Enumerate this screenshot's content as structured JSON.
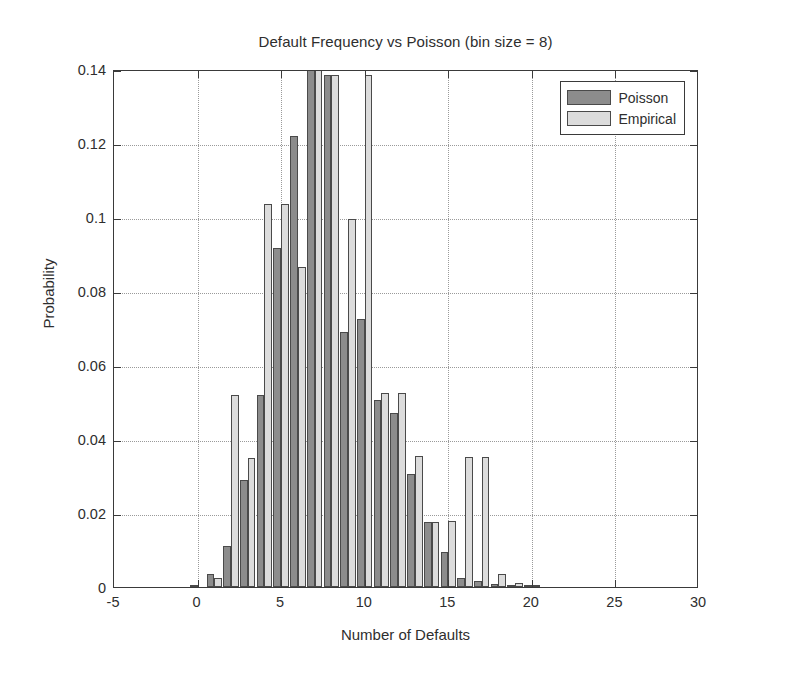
{
  "chart_data": {
    "type": "bar",
    "title": "Default Frequency vs Poisson (bin size = 8)",
    "xlabel": "Number of Defaults",
    "ylabel": "Probability",
    "xlim": [
      -5,
      30
    ],
    "ylim": [
      0,
      0.14
    ],
    "xticks": [
      -5,
      0,
      5,
      10,
      15,
      20,
      25,
      30
    ],
    "xtick_labels": [
      "-5",
      "0",
      "5",
      "10",
      "15",
      "20",
      "25",
      "30"
    ],
    "yticks": [
      0,
      0.02,
      0.04,
      0.06,
      0.08,
      0.1,
      0.12,
      0.14
    ],
    "ytick_labels": [
      "0",
      "0.02",
      "0.04",
      "0.06",
      "0.08",
      "0.1",
      "0.12",
      "0.14"
    ],
    "grid": "dotted",
    "legend_position": "upper-right",
    "colors": {
      "poisson": "#8c8c8c",
      "empirical": "#dcdcdc",
      "axis": "#3a3a3a",
      "grid": "#9a9a9a",
      "background": "#ffffff"
    },
    "x": [
      0,
      1,
      2,
      3,
      4,
      5,
      6,
      7,
      8,
      9,
      10,
      11,
      12,
      13,
      14,
      15,
      16,
      17,
      18,
      19,
      20
    ],
    "series": [
      {
        "name": "Poisson",
        "values": [
          0.0005,
          0.0035,
          0.011,
          0.029,
          0.052,
          0.0915,
          0.122,
          0.145,
          0.1385,
          0.069,
          0.0725,
          0.0505,
          0.047,
          0.0305,
          0.0175,
          0.0095,
          0.0025,
          0.0015,
          0.0008,
          0.0003,
          0.0001
        ]
      },
      {
        "name": "Empirical",
        "values": [
          0.0,
          0.0025,
          0.052,
          0.035,
          0.1035,
          0.1035,
          0.0865,
          0.1405,
          0.1385,
          0.0995,
          0.1385,
          0.0525,
          0.0525,
          0.0355,
          0.0175,
          0.0178,
          0.0352,
          0.0352,
          0.0035,
          0.0012,
          0.0004
        ]
      }
    ]
  },
  "legend": {
    "entries": [
      {
        "label": "Poisson",
        "swatch": "poisson"
      },
      {
        "label": "Empirical",
        "swatch": "empirical"
      }
    ]
  }
}
